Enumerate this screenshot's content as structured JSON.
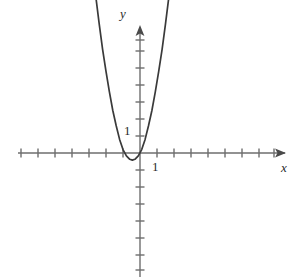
{
  "figure": {
    "title": "",
    "background_color": "#ffffff",
    "width": 300,
    "height": 279
  },
  "axes": {
    "x_axis_label": "x",
    "y_axis_label": "y",
    "x_tick_label": "1",
    "y_tick_label": "1",
    "axis_color": "#6e6e6e",
    "curve_color": "#3a3a3a",
    "origin_px": {
      "x": 140,
      "y": 153
    },
    "unit_px": 17,
    "x_axis_pixel_range": [
      18,
      288
    ],
    "y_axis_pixel_range": [
      26,
      277
    ],
    "x_tick_positions_units": [
      -7,
      -6,
      -5,
      -4,
      -3,
      -2,
      -1,
      1,
      2,
      3,
      4,
      5,
      6,
      7,
      8
    ],
    "y_tick_positions_units": [
      -7,
      -6,
      -5,
      -4,
      -3,
      -2,
      -1,
      1,
      2,
      3,
      4,
      5,
      6,
      7
    ],
    "arrowheads": [
      "x-positive",
      "y-positive"
    ],
    "grid": false,
    "legend": false
  },
  "chart_data": {
    "type": "line",
    "title": "",
    "xlabel": "x",
    "ylabel": "y",
    "grid": false,
    "legend_position": "none",
    "xlim": [
      -7.2,
      8.7
    ],
    "ylim": [
      -7.3,
      7.5
    ],
    "x_tick_labels": [
      "1"
    ],
    "y_tick_labels": [
      "1"
    ],
    "series": [
      {
        "name": "parabola",
        "equation": "y = 2.1*(x + 0.45)^2 - 0.42",
        "vertex": [
          -0.45,
          -0.42
        ],
        "color": "#3a3a3a",
        "x": [
          -3.4,
          -3.2,
          -3.0,
          -2.8,
          -2.6,
          -2.4,
          -2.2,
          -2.0,
          -1.8,
          -1.6,
          -1.4,
          -1.2,
          -1.0,
          -0.8,
          -0.6,
          -0.45,
          -0.3,
          -0.1,
          0.1,
          0.3,
          0.5,
          0.7,
          0.9,
          1.1,
          1.3,
          1.5,
          1.7,
          1.9,
          2.1,
          2.3,
          2.45
        ],
        "y": [
          17.2,
          15.0,
          12.9,
          11.0,
          9.2,
          7.6,
          6.1,
          4.8,
          3.6,
          2.5,
          1.6,
          0.8,
          0.2,
          -0.17,
          -0.37,
          -0.42,
          -0.37,
          -0.17,
          0.2,
          0.8,
          1.6,
          2.5,
          3.6,
          4.8,
          6.1,
          7.6,
          9.2,
          11.0,
          12.9,
          15.0,
          16.2
        ]
      }
    ]
  }
}
